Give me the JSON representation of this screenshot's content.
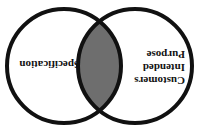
{
  "diagram": {
    "type": "venn",
    "orientation": "rotated-180",
    "sets": [
      {
        "id": "customers-intended-purpose",
        "lines": [
          "Customers",
          "Intended",
          "Purpose"
        ]
      },
      {
        "id": "specification",
        "lines": [
          "Specification"
        ]
      }
    ],
    "intersection_fill": "#6e6e6e",
    "stroke_color": "#111111",
    "background": "#ffffff"
  }
}
